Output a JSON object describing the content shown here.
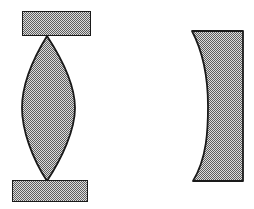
{
  "figure": {
    "title": "Biconvex lens between two plates and a plano-concave element",
    "canvas": {
      "width": 254,
      "height": 209
    },
    "background_color": "#ffffff",
    "stroke_color": "#1a1a1a",
    "hatch_fill_color": "#8c8c8c",
    "hatch_light_color": "#d9d9d9",
    "hatch_dark_color": "#5e5e5e",
    "hatch_pattern": "fine-checkerboard-dither",
    "shapes": [
      {
        "name": "top-plate",
        "label": "Top plate",
        "type": "rectangle",
        "x": 22,
        "y": 11,
        "width": 69,
        "height": 25,
        "stroke_width": 1.6
      },
      {
        "name": "biconvex-lens",
        "label": "Biconvex lens",
        "type": "lens",
        "tip_top": [
          47,
          36
        ],
        "tip_bottom": [
          47,
          181
        ],
        "left_extent": 22,
        "right_extent": 75,
        "mid_y": 108,
        "stroke_width": 1.8
      },
      {
        "name": "bottom-plate",
        "label": "Bottom plate",
        "type": "rectangle",
        "x": 12,
        "y": 180,
        "width": 76,
        "height": 22,
        "stroke_width": 1.6
      },
      {
        "name": "plano-concave-element",
        "label": "Plano-concave element",
        "type": "concave-block",
        "right_edge_x": 243,
        "top_y": 31,
        "bottom_y": 181,
        "top_left_x": 192,
        "bottom_left_x": 193,
        "waist_x": 208,
        "waist_y": 106,
        "stroke_width": 1.8
      }
    ]
  }
}
